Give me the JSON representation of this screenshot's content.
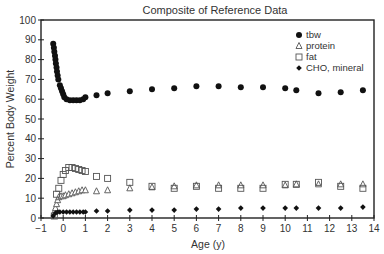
{
  "chart_data": {
    "type": "scatter",
    "title": "Composite of Reference Data",
    "xlabel": "Age (y)",
    "ylabel": "Percent Body Weight",
    "xlim": [
      -1,
      14
    ],
    "ylim": [
      0,
      100
    ],
    "xticks": [
      -1,
      0,
      1,
      2,
      3,
      4,
      5,
      6,
      7,
      8,
      9,
      10,
      11,
      12,
      13,
      14
    ],
    "yticks": [
      0,
      10,
      20,
      30,
      40,
      50,
      60,
      70,
      80,
      90,
      100
    ],
    "grid": false,
    "legend_position": "upper right",
    "series": [
      {
        "name": "tbw",
        "marker": "filled-circle",
        "points": [
          [
            -0.45,
            88
          ],
          [
            -0.42,
            86
          ],
          [
            -0.4,
            84
          ],
          [
            -0.37,
            82
          ],
          [
            -0.35,
            80
          ],
          [
            -0.33,
            78
          ],
          [
            -0.3,
            76
          ],
          [
            -0.28,
            74
          ],
          [
            -0.25,
            72
          ],
          [
            -0.22,
            70
          ],
          [
            -0.15,
            67
          ],
          [
            -0.1,
            65.5
          ],
          [
            -0.05,
            64
          ],
          [
            0.0,
            62.5
          ],
          [
            0.05,
            61
          ],
          [
            0.15,
            60
          ],
          [
            0.3,
            59.5
          ],
          [
            0.45,
            59.5
          ],
          [
            0.6,
            59.5
          ],
          [
            0.75,
            59.5
          ],
          [
            0.9,
            60
          ],
          [
            1.0,
            61
          ],
          [
            1.5,
            62
          ],
          [
            2.0,
            63
          ],
          [
            3,
            64
          ],
          [
            4,
            65
          ],
          [
            5,
            65.5
          ],
          [
            6,
            66.5
          ],
          [
            7,
            66.5
          ],
          [
            8,
            66
          ],
          [
            9,
            66
          ],
          [
            10,
            65.5
          ],
          [
            10.5,
            64.5
          ],
          [
            11.5,
            63
          ],
          [
            12.5,
            63.5
          ],
          [
            13.5,
            64.5
          ]
        ]
      },
      {
        "name": "protein",
        "marker": "open-triangle",
        "points": [
          [
            -0.4,
            3
          ],
          [
            -0.35,
            5
          ],
          [
            -0.3,
            7
          ],
          [
            -0.25,
            9
          ],
          [
            -0.2,
            10.5
          ],
          [
            -0.1,
            11
          ],
          [
            0.0,
            11
          ],
          [
            0.1,
            11.5
          ],
          [
            0.25,
            12
          ],
          [
            0.4,
            12.5
          ],
          [
            0.55,
            13
          ],
          [
            0.7,
            13.5
          ],
          [
            0.85,
            14
          ],
          [
            1.0,
            14
          ],
          [
            1.5,
            13.5
          ],
          [
            2,
            14
          ],
          [
            3,
            15
          ],
          [
            4,
            15.5
          ],
          [
            5,
            16
          ],
          [
            6,
            16.5
          ],
          [
            7,
            16.5
          ],
          [
            8,
            16.5
          ],
          [
            9,
            16.5
          ],
          [
            10,
            16.5
          ],
          [
            10.5,
            17
          ],
          [
            11.5,
            17
          ],
          [
            12.5,
            17
          ],
          [
            13.5,
            17
          ]
        ]
      },
      {
        "name": "fat",
        "marker": "open-square",
        "points": [
          [
            -0.4,
            1
          ],
          [
            -0.3,
            12
          ],
          [
            -0.2,
            15
          ],
          [
            -0.1,
            19
          ],
          [
            0.0,
            22
          ],
          [
            0.1,
            24
          ],
          [
            0.25,
            25.5
          ],
          [
            0.4,
            25.5
          ],
          [
            0.55,
            25
          ],
          [
            0.7,
            24.5
          ],
          [
            0.85,
            24
          ],
          [
            1.0,
            23.5
          ],
          [
            1.5,
            21
          ],
          [
            2,
            20
          ],
          [
            3,
            18
          ],
          [
            4,
            16
          ],
          [
            5,
            15
          ],
          [
            6,
            16
          ],
          [
            7,
            15
          ],
          [
            8,
            15
          ],
          [
            9,
            15
          ],
          [
            10,
            17
          ],
          [
            10.5,
            17
          ],
          [
            11.5,
            18
          ],
          [
            12.5,
            16
          ],
          [
            13.5,
            15
          ]
        ]
      },
      {
        "name": "CHO, mineral",
        "marker": "filled-diamond",
        "points": [
          [
            -0.45,
            1
          ],
          [
            -0.35,
            2.5
          ],
          [
            -0.25,
            3
          ],
          [
            -0.15,
            3
          ],
          [
            0.0,
            3
          ],
          [
            0.15,
            3
          ],
          [
            0.3,
            3
          ],
          [
            0.45,
            3
          ],
          [
            0.6,
            3
          ],
          [
            0.75,
            3
          ],
          [
            0.9,
            3
          ],
          [
            1.0,
            3
          ],
          [
            1.5,
            3.5
          ],
          [
            2,
            3.5
          ],
          [
            3,
            4
          ],
          [
            4,
            4
          ],
          [
            5,
            4
          ],
          [
            6,
            4.5
          ],
          [
            7,
            4.5
          ],
          [
            8,
            5
          ],
          [
            9,
            5
          ],
          [
            10,
            5
          ],
          [
            10.5,
            5
          ],
          [
            11.5,
            5
          ],
          [
            12.5,
            5
          ],
          [
            13.5,
            5.5
          ]
        ]
      }
    ]
  },
  "legend": {
    "items": [
      {
        "label": "tbw",
        "marker": "filled-circle"
      },
      {
        "label": "protein",
        "marker": "open-triangle"
      },
      {
        "label": "fat",
        "marker": "open-square"
      },
      {
        "label": "CHO, mineral",
        "marker": "filled-diamond"
      }
    ]
  },
  "colors": {
    "marker": "#111111",
    "axis": "#222222",
    "text": "#333333"
  }
}
